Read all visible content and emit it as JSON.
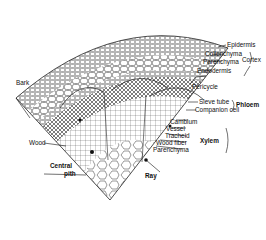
{
  "figure": {
    "labels": {
      "epidermis": "Epidermis",
      "collenchyma": "Collenchyma",
      "parenchyma_cortex": "Parenchyma",
      "endodermis": "Endodermis",
      "cortex": "Cortex",
      "bark": "Bark",
      "pericycle": "Pericycle",
      "sieve_tube": "Sieve tube",
      "companion_cell": "Companion cell",
      "phloem": "Phloem",
      "cambium": "Cambium",
      "vessel": "Vessel",
      "tracheid": "Tracheid",
      "wood_fiber": "Wood fiber",
      "parenchyma_xylem": "Parenchyma",
      "xylem": "Xylem",
      "wood": "Wood",
      "central_pith_line1": "Central",
      "central_pith_line2": "pith",
      "ray": "Ray"
    },
    "colors": {
      "ink": "#1a1a1a",
      "background": "#ffffff"
    }
  }
}
